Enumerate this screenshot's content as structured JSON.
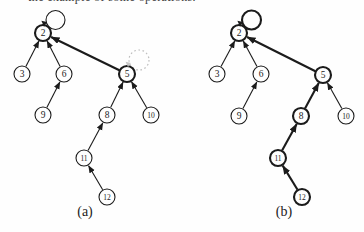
{
  "page": {
    "background": "#fefefe",
    "ink": "#1b1b1b",
    "ghost_color": "#bdbdbd",
    "node_fill": "#fefefe"
  },
  "top_text": {
    "fragment": "the example of some operations."
  },
  "diagrams": [
    {
      "key": "a",
      "caption": "(a)",
      "nodes": [
        {
          "id": "2",
          "x": 43,
          "y": 33,
          "bold": true,
          "self_loop": "thin"
        },
        {
          "id": "3",
          "x": 22,
          "y": 74,
          "bold": false
        },
        {
          "id": "6",
          "x": 64,
          "y": 74,
          "bold": false
        },
        {
          "id": "5",
          "x": 127,
          "y": 74,
          "bold": true,
          "ghost_loop": true
        },
        {
          "id": "9",
          "x": 43,
          "y": 115,
          "bold": false
        },
        {
          "id": "8",
          "x": 107,
          "y": 115,
          "bold": false
        },
        {
          "id": "10",
          "x": 151,
          "y": 115,
          "bold": false
        },
        {
          "id": "11",
          "x": 84,
          "y": 158,
          "bold": false
        },
        {
          "id": "12",
          "x": 107,
          "y": 197,
          "bold": false
        }
      ],
      "edges": [
        {
          "from": "3",
          "to": "2",
          "bold": false
        },
        {
          "from": "6",
          "to": "2",
          "bold": false
        },
        {
          "from": "5",
          "to": "2",
          "bold": true
        },
        {
          "from": "9",
          "to": "6",
          "bold": false
        },
        {
          "from": "8",
          "to": "5",
          "bold": false
        },
        {
          "from": "10",
          "to": "5",
          "bold": false
        },
        {
          "from": "11",
          "to": "8",
          "bold": false
        },
        {
          "from": "12",
          "to": "11",
          "bold": false
        }
      ]
    },
    {
      "key": "b",
      "caption": "(b)",
      "nodes": [
        {
          "id": "2",
          "x": 239,
          "y": 33,
          "bold": true,
          "self_loop": "thick"
        },
        {
          "id": "3",
          "x": 217,
          "y": 74,
          "bold": false
        },
        {
          "id": "6",
          "x": 261,
          "y": 74,
          "bold": false
        },
        {
          "id": "5",
          "x": 323,
          "y": 75,
          "bold": true
        },
        {
          "id": "9",
          "x": 239,
          "y": 116,
          "bold": false
        },
        {
          "id": "8",
          "x": 301,
          "y": 116,
          "bold": true
        },
        {
          "id": "10",
          "x": 346,
          "y": 116,
          "bold": false
        },
        {
          "id": "11",
          "x": 278,
          "y": 158,
          "bold": true
        },
        {
          "id": "12",
          "x": 302,
          "y": 197,
          "bold": true
        }
      ],
      "edges": [
        {
          "from": "3",
          "to": "2",
          "bold": false
        },
        {
          "from": "6",
          "to": "2",
          "bold": false
        },
        {
          "from": "5",
          "to": "2",
          "bold": true
        },
        {
          "from": "9",
          "to": "6",
          "bold": false
        },
        {
          "from": "8",
          "to": "5",
          "bold": true
        },
        {
          "from": "10",
          "to": "5",
          "bold": false
        },
        {
          "from": "11",
          "to": "8",
          "bold": true
        },
        {
          "from": "12",
          "to": "11",
          "bold": true
        }
      ]
    }
  ],
  "style": {
    "node_radius": 8,
    "stroke_thin": 1.1,
    "stroke_bold": 2.1
  }
}
